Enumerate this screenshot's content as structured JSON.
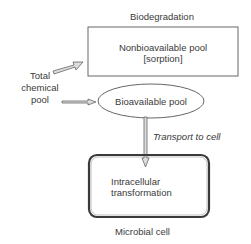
{
  "diagram": {
    "title": "Biodegradation",
    "source": {
      "line1": "Total",
      "line2": "chemical",
      "line3": "pool"
    },
    "nonbioavailable_pool": {
      "line1": "Nonbioavailable pool",
      "line2": "[sorption]"
    },
    "bioavailable_pool": {
      "label": "Bioavailable pool"
    },
    "transport": {
      "label": "Transport to cell"
    },
    "cell": {
      "inner_line1": "Intracellular",
      "inner_line2": "transformation",
      "caption": "Microbial cell"
    },
    "colors": {
      "stroke": "#555555",
      "arrow_fill": "#dddddd",
      "cell_border": "#3a3a3a"
    }
  }
}
